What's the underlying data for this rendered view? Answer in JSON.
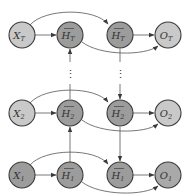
{
  "diagram": {
    "type": "bidirectional-rnn",
    "colors": {
      "input_fill": "#c9c9c9",
      "hidden_fill": "#9c9c9c",
      "output_fill": "#c9c9c9",
      "output_1_fill": "#a9a9a9",
      "stroke": "#3a3a3a",
      "edge": "#555555"
    },
    "nodes": [
      {
        "id": "X_T",
        "base": "X",
        "sub": "T",
        "accent": "",
        "role": "input",
        "row": "T"
      },
      {
        "id": "Hf_T",
        "base": "H",
        "sub": "T",
        "accent": "→",
        "role": "forward-hidden",
        "row": "T"
      },
      {
        "id": "Hb_T",
        "base": "H",
        "sub": "T",
        "accent": "←",
        "role": "backward-hidden",
        "row": "T"
      },
      {
        "id": "O_T",
        "base": "O",
        "sub": "T",
        "accent": "",
        "role": "output",
        "row": "T"
      },
      {
        "id": "X_2",
        "base": "X",
        "sub": "2",
        "accent": "",
        "role": "input",
        "row": "2"
      },
      {
        "id": "Hf_2",
        "base": "H",
        "sub": "2",
        "accent": "→",
        "role": "forward-hidden",
        "row": "2"
      },
      {
        "id": "Hb_2",
        "base": "H",
        "sub": "2",
        "accent": "←",
        "role": "backward-hidden",
        "row": "2"
      },
      {
        "id": "O_2",
        "base": "O",
        "sub": "2",
        "accent": "",
        "role": "output",
        "row": "2"
      },
      {
        "id": "X_1",
        "base": "X",
        "sub": "1",
        "accent": "",
        "role": "input",
        "row": "1"
      },
      {
        "id": "Hf_1",
        "base": "H",
        "sub": "1",
        "accent": "→",
        "role": "forward-hidden",
        "row": "1"
      },
      {
        "id": "Hb_1",
        "base": "H",
        "sub": "1",
        "accent": "←",
        "role": "backward-hidden",
        "row": "1"
      },
      {
        "id": "O_1",
        "base": "O",
        "sub": "1",
        "accent": "",
        "role": "output",
        "row": "1"
      }
    ],
    "labels": {
      "X_T": {
        "base": "X",
        "sub": "T"
      },
      "Hf_T": {
        "base": "H",
        "sub": "T"
      },
      "Hb_T": {
        "base": "H",
        "sub": "T"
      },
      "O_T": {
        "base": "O",
        "sub": "T"
      },
      "X_2": {
        "base": "X",
        "sub": "2"
      },
      "Hf_2": {
        "base": "H",
        "sub": "2"
      },
      "Hb_2": {
        "base": "H",
        "sub": "2"
      },
      "O_2": {
        "base": "O",
        "sub": "2"
      },
      "X_1": {
        "base": "X",
        "sub": "1"
      },
      "Hf_1": {
        "base": "H",
        "sub": "1"
      },
      "Hb_1": {
        "base": "H",
        "sub": "1"
      },
      "O_1": {
        "base": "O",
        "sub": "1"
      }
    },
    "edges": [
      {
        "from": "X_1",
        "to": "Hf_1"
      },
      {
        "from": "X_1",
        "to": "Hb_1"
      },
      {
        "from": "Hf_1",
        "to": "O_1"
      },
      {
        "from": "Hb_1",
        "to": "O_1"
      },
      {
        "from": "X_2",
        "to": "Hf_2"
      },
      {
        "from": "X_2",
        "to": "Hb_2"
      },
      {
        "from": "Hf_2",
        "to": "O_2"
      },
      {
        "from": "Hb_2",
        "to": "O_2"
      },
      {
        "from": "X_T",
        "to": "Hf_T"
      },
      {
        "from": "X_T",
        "to": "Hb_T"
      },
      {
        "from": "Hf_T",
        "to": "O_T"
      },
      {
        "from": "Hb_T",
        "to": "O_T"
      },
      {
        "from": "Hf_1",
        "to": "Hf_2"
      },
      {
        "from": "Hf_2",
        "to": "Hf_T",
        "style": "dotted"
      },
      {
        "from": "Hb_T",
        "to": "Hb_2",
        "style": "dotted"
      },
      {
        "from": "Hb_2",
        "to": "Hb_1"
      }
    ],
    "ellipsis": "⋮"
  }
}
